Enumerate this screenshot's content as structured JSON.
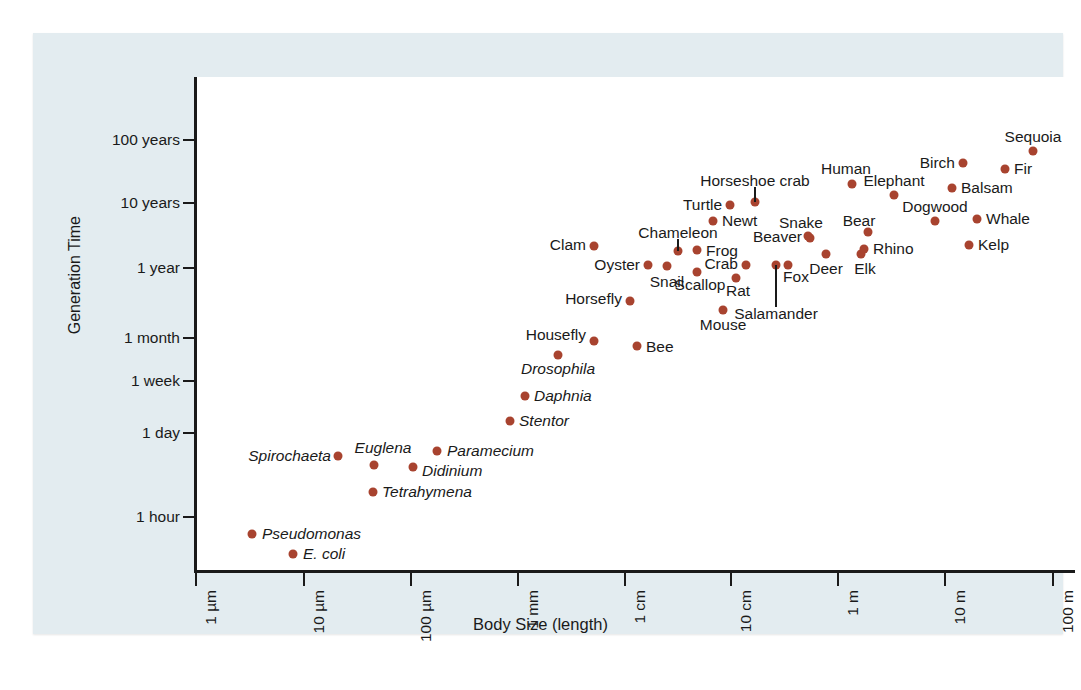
{
  "figure": {
    "x_axis_title": "Body Size (length)",
    "y_axis_title": "Generation Time",
    "marker_color": "#a8432f",
    "panel_color": "#e3ecf0"
  },
  "chart_data": {
    "type": "scatter",
    "title": "",
    "xlabel": "Body Size (length)",
    "ylabel": "Generation Time",
    "x_scale": "log",
    "y_scale": "log",
    "xlim": [
      "1 µm",
      "100 m"
    ],
    "ylim": [
      "below 1 hour",
      "above 100 years"
    ],
    "grid": false,
    "legend": null,
    "xticks": [
      "1 µm",
      "10 µm",
      "100 µm",
      "1 mm",
      "1 cm",
      "10 cm",
      "1 m",
      "10 m",
      "100 m"
    ],
    "yticks": [
      "100 years",
      "10 years",
      "1 year",
      "1 month",
      "1 week",
      "1 day",
      "1 hour"
    ],
    "points": [
      {
        "name": "E. coli",
        "italic": true,
        "px": 260,
        "py": 521,
        "lx": 270,
        "ly": 521,
        "anchor": "start"
      },
      {
        "name": "Pseudomonas",
        "italic": true,
        "px": 219,
        "py": 501,
        "lx": 229,
        "ly": 501,
        "anchor": "start"
      },
      {
        "name": "Tetrahymena",
        "italic": true,
        "px": 340,
        "py": 459,
        "lx": 349,
        "ly": 459,
        "anchor": "start"
      },
      {
        "name": "Spirochaeta",
        "italic": true,
        "px": 305,
        "py": 423,
        "lx": 298,
        "ly": 423,
        "anchor": "end"
      },
      {
        "name": "Euglena",
        "italic": true,
        "px": 341,
        "py": 432,
        "lx": 350,
        "ly": 415,
        "anchor": "mid"
      },
      {
        "name": "Didinium",
        "italic": true,
        "px": 380,
        "py": 434,
        "lx": 389,
        "ly": 438,
        "anchor": "start"
      },
      {
        "name": "Paramecium",
        "italic": true,
        "px": 404,
        "py": 418,
        "lx": 414,
        "ly": 418,
        "anchor": "start"
      },
      {
        "name": "Stentor",
        "italic": true,
        "px": 477,
        "py": 388,
        "lx": 486,
        "ly": 388,
        "anchor": "start"
      },
      {
        "name": "Daphnia",
        "italic": true,
        "px": 492,
        "py": 363,
        "lx": 501,
        "ly": 363,
        "anchor": "start"
      },
      {
        "name": "Drosophila",
        "italic": true,
        "px": 525,
        "py": 322,
        "lx": 525,
        "ly": 336,
        "anchor": "mid"
      },
      {
        "name": "Housefly",
        "italic": false,
        "px": 561,
        "py": 308,
        "lx": 553,
        "ly": 302,
        "anchor": "end"
      },
      {
        "name": "Bee",
        "italic": false,
        "px": 604,
        "py": 313,
        "lx": 613,
        "ly": 314,
        "anchor": "start"
      },
      {
        "name": "Horsefly",
        "italic": false,
        "px": 597,
        "py": 268,
        "lx": 589,
        "ly": 266,
        "anchor": "end"
      },
      {
        "name": "Mouse",
        "italic": false,
        "px": 690,
        "py": 277,
        "lx": 690,
        "ly": 292,
        "anchor": "mid"
      },
      {
        "name": "Clam",
        "italic": false,
        "px": 561,
        "py": 213,
        "lx": 553,
        "ly": 212,
        "anchor": "end"
      },
      {
        "name": "Oyster",
        "italic": false,
        "px": 615,
        "py": 232,
        "lx": 607,
        "ly": 232,
        "anchor": "end"
      },
      {
        "name": "Snail",
        "italic": false,
        "px": 634,
        "py": 233,
        "lx": 634,
        "ly": 249,
        "anchor": "mid"
      },
      {
        "name": "Scallop",
        "italic": false,
        "px": 664,
        "py": 239,
        "lx": 667,
        "ly": 252,
        "anchor": "mid"
      },
      {
        "name": "Chameleon",
        "italic": false,
        "px": 645,
        "py": 218,
        "lx": 645,
        "ly": 200,
        "anchor": "mid"
      },
      {
        "name": "Frog",
        "italic": false,
        "px": 664,
        "py": 217,
        "lx": 673,
        "ly": 218,
        "anchor": "start"
      },
      {
        "name": "Crab",
        "italic": false,
        "px": 713,
        "py": 232,
        "lx": 705,
        "ly": 231,
        "anchor": "end"
      },
      {
        "name": "Rat",
        "italic": false,
        "px": 703,
        "py": 245,
        "lx": 705,
        "ly": 258,
        "anchor": "mid"
      },
      {
        "name": "Newt",
        "italic": false,
        "px": 680,
        "py": 188,
        "lx": 689,
        "ly": 188,
        "anchor": "start"
      },
      {
        "name": "Turtle",
        "italic": false,
        "px": 697,
        "py": 172,
        "lx": 689,
        "ly": 172,
        "anchor": "end"
      },
      {
        "name": "Horseshoe crab",
        "italic": false,
        "px": 722,
        "py": 169,
        "lx": 722,
        "ly": 148,
        "anchor": "mid"
      },
      {
        "name": "Salamander",
        "italic": false,
        "px": 743,
        "py": 232,
        "lx": 743,
        "ly": 281,
        "anchor": "mid"
      },
      {
        "name": "Fox",
        "italic": false,
        "px": 755,
        "py": 232,
        "lx": 763,
        "ly": 244,
        "anchor": "mid"
      },
      {
        "name": "Beaver",
        "italic": false,
        "px": 777,
        "py": 205,
        "lx": 769,
        "ly": 204,
        "anchor": "end"
      },
      {
        "name": "Deer",
        "italic": false,
        "px": 793,
        "py": 221,
        "lx": 793,
        "ly": 236,
        "anchor": "mid"
      },
      {
        "name": "Snake",
        "italic": false,
        "px": 775,
        "py": 203,
        "lx": 768,
        "ly": 190,
        "anchor": "mid"
      },
      {
        "name": "Elk",
        "italic": false,
        "px": 828,
        "py": 221,
        "lx": 832,
        "ly": 236,
        "anchor": "mid"
      },
      {
        "name": "Bear",
        "italic": false,
        "px": 835,
        "py": 199,
        "lx": 826,
        "ly": 188,
        "anchor": "mid"
      },
      {
        "name": "Rhino",
        "italic": false,
        "px": 831,
        "py": 216,
        "lx": 840,
        "ly": 216,
        "anchor": "start"
      },
      {
        "name": "Human",
        "italic": false,
        "px": 819,
        "py": 151,
        "lx": 813,
        "ly": 136,
        "anchor": "mid"
      },
      {
        "name": "Elephant",
        "italic": false,
        "px": 861,
        "py": 162,
        "lx": 861,
        "ly": 148,
        "anchor": "mid"
      },
      {
        "name": "Dogwood",
        "italic": false,
        "px": 902,
        "py": 188,
        "lx": 902,
        "ly": 174,
        "anchor": "mid"
      },
      {
        "name": "Whale",
        "italic": false,
        "px": 944,
        "py": 186,
        "lx": 953,
        "ly": 186,
        "anchor": "start"
      },
      {
        "name": "Kelp",
        "italic": false,
        "px": 936,
        "py": 212,
        "lx": 945,
        "ly": 212,
        "anchor": "start"
      },
      {
        "name": "Balsam",
        "italic": false,
        "px": 919,
        "py": 155,
        "lx": 928,
        "ly": 155,
        "anchor": "start"
      },
      {
        "name": "Birch",
        "italic": false,
        "px": 930,
        "py": 130,
        "lx": 922,
        "ly": 130,
        "anchor": "end"
      },
      {
        "name": "Fir",
        "italic": false,
        "px": 972,
        "py": 136,
        "lx": 981,
        "ly": 136,
        "anchor": "start"
      },
      {
        "name": "Sequoia",
        "italic": false,
        "px": 1000,
        "py": 118,
        "lx": 1000,
        "ly": 104,
        "anchor": "mid"
      }
    ],
    "leaders": [
      {
        "name": "chameleon-leader",
        "x": 645,
        "y_top": 206,
        "y_bottom": 218
      },
      {
        "name": "horseshoe-crab-leader",
        "x": 722,
        "y_top": 154,
        "y_bottom": 169
      },
      {
        "name": "salamander-leader",
        "x": 743,
        "y_top": 232,
        "y_bottom": 274
      }
    ]
  },
  "axis_geometry": {
    "yticks": [
      {
        "label": "100 years",
        "y": 107
      },
      {
        "label": "10 years",
        "y": 170
      },
      {
        "label": "1 year",
        "y": 235
      },
      {
        "label": "1 month",
        "y": 305
      },
      {
        "label": "1 week",
        "y": 348
      },
      {
        "label": "1 day",
        "y": 400
      },
      {
        "label": "1 hour",
        "y": 484
      }
    ],
    "xticks": [
      {
        "label": "1 µm",
        "x": 163
      },
      {
        "label": "10 µm",
        "x": 271
      },
      {
        "label": "100 µm",
        "x": 378
      },
      {
        "label": "1 mm",
        "x": 485
      },
      {
        "label": "1 cm",
        "x": 592
      },
      {
        "label": "10 cm",
        "x": 698
      },
      {
        "label": "1 m",
        "x": 805
      },
      {
        "label": "10 m",
        "x": 912
      },
      {
        "label": "100 m",
        "x": 1020
      }
    ]
  }
}
